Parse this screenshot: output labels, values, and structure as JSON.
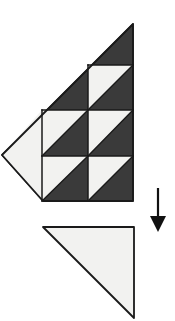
{
  "figure": {
    "canvas": {
      "width": 175,
      "height": 321,
      "background": "#ffffff"
    },
    "colors": {
      "dark": "#3a3a3a",
      "light": "#f2f2f0",
      "stroke": "#1a1a1a",
      "arrow": "#111111",
      "background": "#ffffff"
    },
    "stroke_width": 1.6,
    "shapes": {
      "main_figure": {
        "name": "patterned-right-triangle",
        "outline": "133,24 133,201 43,201 2,155",
        "apex": [
          133,
          24
        ],
        "left_point": [
          2,
          155
        ],
        "bottom_left": [
          43,
          201
        ],
        "bottom_right": [
          133,
          201
        ],
        "grid_x": [
          42,
          88,
          133
        ],
        "grid_y": [
          65,
          110,
          156,
          201
        ],
        "cell_size": 45.5,
        "background_fill": "#3a3a3a",
        "left_wedge": {
          "name": "left-light-wedge",
          "points": "2,155 42,110 42,201",
          "fill": "#f2f2f0"
        },
        "hst_cells": [
          {
            "row": 0,
            "col": 2,
            "points": "88,65 133,65 88,110",
            "fill": "#f2f2f0"
          },
          {
            "row": 1,
            "col": 1,
            "points": "42,110 88,110 42,156",
            "fill": "#f2f2f0"
          },
          {
            "row": 1,
            "col": 2,
            "points": "88,110 133,110 88,156",
            "fill": "#f2f2f0"
          },
          {
            "row": 2,
            "col": 1,
            "points": "42,156 88,156 42,201",
            "fill": "#f2f2f0"
          },
          {
            "row": 2,
            "col": 2,
            "points": "88,156 133,156 88,201",
            "fill": "#f2f2f0"
          }
        ],
        "grid_lines": [
          {
            "name": "vline-x42",
            "x1": 42,
            "y1": 110,
            "x2": 42,
            "y2": 201
          },
          {
            "name": "vline-x88",
            "x1": 88,
            "y1": 65,
            "x2": 88,
            "y2": 201
          },
          {
            "name": "hline-y65",
            "x1": 88,
            "y1": 65,
            "x2": 133,
            "y2": 65
          },
          {
            "name": "hline-y110",
            "x1": 42,
            "y1": 110,
            "x2": 133,
            "y2": 110
          },
          {
            "name": "hline-y156",
            "x1": 42,
            "y1": 156,
            "x2": 133,
            "y2": 156
          }
        ],
        "diagonals": [
          {
            "name": "diag-r0c2",
            "x1": 88,
            "y1": 110,
            "x2": 133,
            "y2": 65
          },
          {
            "name": "diag-r1c1",
            "x1": 42,
            "y1": 156,
            "x2": 88,
            "y2": 110
          },
          {
            "name": "diag-r1c2",
            "x1": 88,
            "y1": 156,
            "x2": 133,
            "y2": 110
          },
          {
            "name": "diag-r2c1",
            "x1": 42,
            "y1": 201,
            "x2": 88,
            "y2": 156
          },
          {
            "name": "diag-r2c2",
            "x1": 88,
            "y1": 201,
            "x2": 133,
            "y2": 156
          }
        ]
      },
      "arrow": {
        "name": "down-arrow",
        "x": 158,
        "shaft_top": 188,
        "shaft_bottom": 219,
        "head_points": "150,216 166,216 158,232",
        "direction": "down",
        "color": "#111111",
        "shaft_width": 2.2
      },
      "result_figure": {
        "name": "plain-light-right-triangle",
        "points": "43,227 134,227 134,318",
        "top_left": [
          43,
          227
        ],
        "top_right": [
          134,
          227
        ],
        "bottom_right": [
          134,
          318
        ],
        "fill": "#f2f2f0",
        "stroke": "#1a1a1a"
      }
    }
  }
}
